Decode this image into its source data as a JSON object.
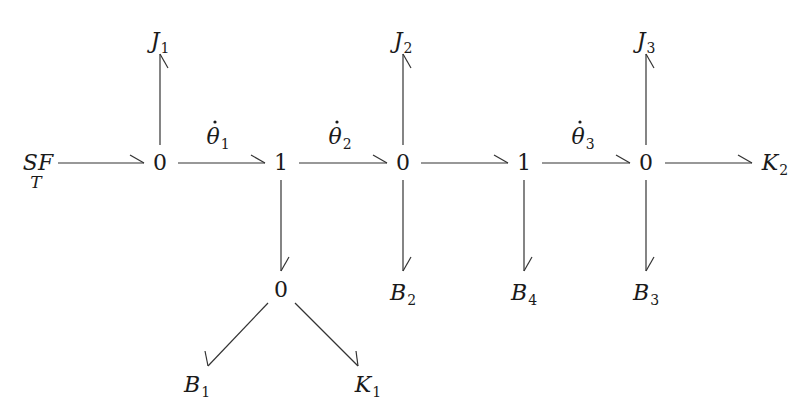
{
  "diagram": {
    "type": "bond-graph",
    "colors": {
      "ink": "#1a1a1a",
      "bond": "#333333",
      "background": "#ffffff"
    },
    "nodes": [
      {
        "id": "SF",
        "label": "SF",
        "sublabel": "T",
        "x": 38,
        "y": 170
      },
      {
        "id": "z1",
        "label": "0",
        "x": 160,
        "y": 170
      },
      {
        "id": "o1",
        "label": "1",
        "x": 281,
        "y": 170
      },
      {
        "id": "z2",
        "label": "0",
        "x": 403,
        "y": 170
      },
      {
        "id": "o2",
        "label": "1",
        "x": 524,
        "y": 170
      },
      {
        "id": "z3",
        "label": "0",
        "x": 646,
        "y": 170
      },
      {
        "id": "K2",
        "label": "K",
        "sub": "2",
        "x": 775,
        "y": 170
      },
      {
        "id": "J1",
        "label": "J",
        "sub": "1",
        "x": 160,
        "y": 48
      },
      {
        "id": "J2",
        "label": "J",
        "sub": "2",
        "x": 403,
        "y": 48
      },
      {
        "id": "J3",
        "label": "J",
        "sub": "3",
        "x": 646,
        "y": 48
      },
      {
        "id": "z4",
        "label": "0",
        "x": 281,
        "y": 297
      },
      {
        "id": "B1",
        "label": "B",
        "sub": "1",
        "x": 197,
        "y": 392
      },
      {
        "id": "K1",
        "label": "K",
        "sub": "1",
        "x": 368,
        "y": 392
      },
      {
        "id": "B2",
        "label": "B",
        "sub": "2",
        "x": 403,
        "y": 300
      },
      {
        "id": "B4",
        "label": "B",
        "sub": "4",
        "x": 524,
        "y": 300
      },
      {
        "id": "B3",
        "label": "B",
        "sub": "3",
        "x": 646,
        "y": 300
      }
    ],
    "bond_labels": [
      {
        "id": "th1",
        "symbol": "θ",
        "dot": "˙",
        "sub": "1",
        "x": 218,
        "y": 144
      },
      {
        "id": "th2",
        "symbol": "θ",
        "dot": "˙",
        "sub": "2",
        "x": 340,
        "y": 144
      },
      {
        "id": "th3",
        "symbol": "θ",
        "dot": "˙",
        "sub": "3",
        "x": 583,
        "y": 144
      }
    ],
    "bonds": [
      {
        "from": "SF",
        "to": "z1",
        "x1": 58,
        "y1": 163,
        "x2": 144,
        "y2": 163,
        "dir": "right"
      },
      {
        "from": "z1",
        "to": "o1",
        "x1": 178,
        "y1": 163,
        "x2": 265,
        "y2": 163,
        "dir": "right",
        "label": "th1"
      },
      {
        "from": "o1",
        "to": "z2",
        "x1": 299,
        "y1": 163,
        "x2": 387,
        "y2": 163,
        "dir": "right",
        "label": "th2"
      },
      {
        "from": "z2",
        "to": "o2",
        "x1": 421,
        "y1": 163,
        "x2": 508,
        "y2": 163,
        "dir": "right"
      },
      {
        "from": "o2",
        "to": "z3",
        "x1": 542,
        "y1": 163,
        "x2": 630,
        "y2": 163,
        "dir": "right",
        "label": "th3"
      },
      {
        "from": "z3",
        "to": "K2",
        "x1": 665,
        "y1": 163,
        "x2": 752,
        "y2": 163,
        "dir": "right"
      },
      {
        "from": "z1",
        "to": "J1",
        "x1": 160,
        "y1": 145,
        "x2": 160,
        "y2": 54,
        "dir": "up"
      },
      {
        "from": "z2",
        "to": "J2",
        "x1": 403,
        "y1": 145,
        "x2": 403,
        "y2": 54,
        "dir": "up"
      },
      {
        "from": "z3",
        "to": "J3",
        "x1": 646,
        "y1": 145,
        "x2": 646,
        "y2": 54,
        "dir": "up"
      },
      {
        "from": "o1",
        "to": "z4",
        "x1": 281,
        "y1": 180,
        "x2": 281,
        "y2": 271,
        "dir": "down"
      },
      {
        "from": "z2",
        "to": "B2",
        "x1": 403,
        "y1": 180,
        "x2": 403,
        "y2": 271,
        "dir": "down"
      },
      {
        "from": "o2",
        "to": "B4",
        "x1": 524,
        "y1": 180,
        "x2": 524,
        "y2": 271,
        "dir": "down"
      },
      {
        "from": "z3",
        "to": "B3",
        "x1": 646,
        "y1": 180,
        "x2": 646,
        "y2": 271,
        "dir": "down"
      },
      {
        "from": "z4",
        "to": "B1",
        "x1": 268,
        "y1": 303,
        "x2": 208,
        "y2": 366,
        "dir": "down-left"
      },
      {
        "from": "z4",
        "to": "K1",
        "x1": 295,
        "y1": 303,
        "x2": 358,
        "y2": 366,
        "dir": "down-right"
      }
    ]
  }
}
